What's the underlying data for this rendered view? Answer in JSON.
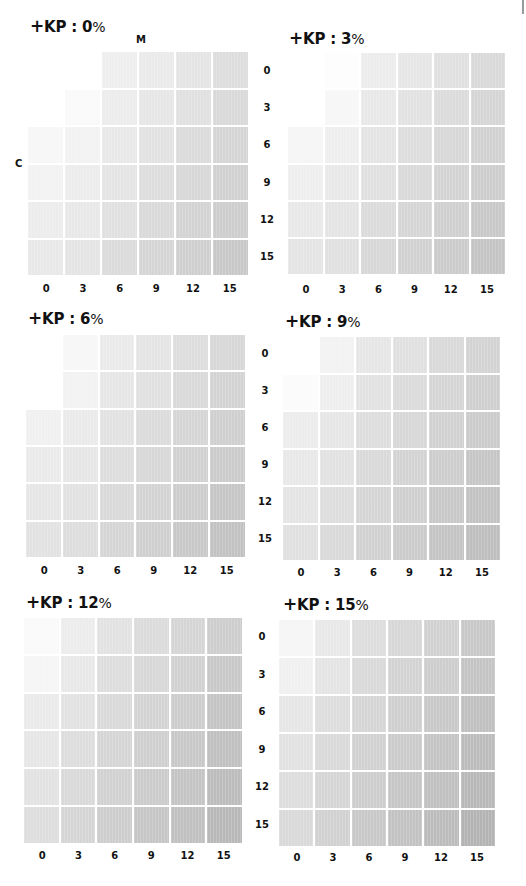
{
  "chart_data": [
    {
      "type": "heatmap",
      "title": "+KP : 0%",
      "xlabel": "M",
      "ylabel": "C",
      "x_ticks": [
        "0",
        "3",
        "6",
        "9",
        "12",
        "15"
      ],
      "y_ticks": [
        "0",
        "3",
        "6",
        "9",
        "12",
        "15"
      ],
      "grid": true,
      "values": [
        [
          0,
          0,
          8,
          10,
          13,
          16
        ],
        [
          0,
          3,
          9,
          12,
          15,
          18
        ],
        [
          4,
          6,
          11,
          14,
          17,
          20
        ],
        [
          6,
          9,
          13,
          16,
          19,
          22
        ],
        [
          9,
          11,
          15,
          18,
          21,
          24
        ],
        [
          11,
          13,
          17,
          20,
          23,
          26
        ]
      ]
    },
    {
      "type": "heatmap",
      "title": "+KP : 3%",
      "xlabel": "M",
      "ylabel": "C",
      "x_ticks": [
        "0",
        "3",
        "6",
        "9",
        "12",
        "15"
      ],
      "y_ticks": [
        "0",
        "3",
        "6",
        "9",
        "12",
        "15"
      ],
      "grid": true,
      "values": [
        [
          0,
          1,
          9,
          12,
          15,
          18
        ],
        [
          0,
          4,
          11,
          14,
          17,
          20
        ],
        [
          5,
          8,
          13,
          16,
          19,
          22
        ],
        [
          8,
          11,
          15,
          18,
          21,
          24
        ],
        [
          11,
          13,
          17,
          20,
          23,
          26
        ],
        [
          13,
          15,
          19,
          22,
          25,
          28
        ]
      ]
    },
    {
      "type": "heatmap",
      "title": "+KP : 6%",
      "xlabel": "M",
      "ylabel": "C",
      "x_ticks": [
        "0",
        "3",
        "6",
        "9",
        "12",
        "15"
      ],
      "y_ticks": [
        "0",
        "3",
        "6",
        "9",
        "12",
        "15"
      ],
      "grid": true,
      "values": [
        [
          0,
          4,
          10,
          13,
          16,
          19
        ],
        [
          0,
          6,
          12,
          15,
          18,
          21
        ],
        [
          7,
          10,
          14,
          17,
          20,
          23
        ],
        [
          10,
          12,
          16,
          19,
          22,
          25
        ],
        [
          12,
          14,
          18,
          21,
          24,
          27
        ],
        [
          14,
          16,
          20,
          23,
          26,
          29
        ]
      ]
    },
    {
      "type": "heatmap",
      "title": "+KP : 9%",
      "xlabel": "M",
      "ylabel": "C",
      "x_ticks": [
        "0",
        "3",
        "6",
        "9",
        "12",
        "15"
      ],
      "y_ticks": [
        "0",
        "3",
        "6",
        "9",
        "12",
        "15"
      ],
      "grid": true,
      "values": [
        [
          0,
          6,
          12,
          15,
          18,
          21
        ],
        [
          2,
          8,
          14,
          17,
          20,
          23
        ],
        [
          9,
          12,
          16,
          19,
          22,
          25
        ],
        [
          11,
          14,
          18,
          21,
          24,
          27
        ],
        [
          13,
          16,
          20,
          23,
          26,
          29
        ],
        [
          15,
          18,
          22,
          25,
          28,
          31
        ]
      ]
    },
    {
      "type": "heatmap",
      "title": "+KP : 12%",
      "xlabel": "M",
      "ylabel": "C",
      "x_ticks": [
        "0",
        "3",
        "6",
        "9",
        "12",
        "15"
      ],
      "y_ticks": [
        "0",
        "3",
        "6",
        "9",
        "12",
        "15"
      ],
      "grid": true,
      "values": [
        [
          3,
          9,
          14,
          17,
          20,
          24
        ],
        [
          5,
          11,
          16,
          19,
          22,
          26
        ],
        [
          10,
          14,
          18,
          21,
          24,
          28
        ],
        [
          12,
          16,
          20,
          23,
          26,
          30
        ],
        [
          14,
          18,
          22,
          25,
          28,
          32
        ],
        [
          16,
          20,
          24,
          27,
          30,
          34
        ]
      ]
    },
    {
      "type": "heatmap",
      "title": "+KP : 15%",
      "xlabel": "M",
      "ylabel": "C",
      "x_ticks": [
        "0",
        "3",
        "6",
        "9",
        "12",
        "15"
      ],
      "y_ticks": [
        "0",
        "3",
        "6",
        "9",
        "12",
        "15"
      ],
      "grid": true,
      "values": [
        [
          5,
          11,
          16,
          19,
          22,
          26
        ],
        [
          7,
          13,
          18,
          21,
          24,
          28
        ],
        [
          12,
          16,
          20,
          23,
          26,
          30
        ],
        [
          14,
          18,
          22,
          25,
          28,
          32
        ],
        [
          16,
          20,
          24,
          27,
          30,
          34
        ],
        [
          18,
          22,
          26,
          29,
          32,
          36
        ]
      ]
    }
  ],
  "panels": [
    {
      "plus": "+",
      "kp": "KP : 0",
      "pct": "%"
    },
    {
      "plus": "+",
      "kp": "KP : 3",
      "pct": "%"
    },
    {
      "plus": "+",
      "kp": "KP : 6",
      "pct": "%"
    },
    {
      "plus": "+",
      "kp": "KP : 9",
      "pct": "%"
    },
    {
      "plus": "+",
      "kp": "KP : 12",
      "pct": "%"
    },
    {
      "plus": "+",
      "kp": "KP : 15",
      "pct": "%"
    }
  ],
  "axis": {
    "m_label": "M",
    "c_label": "C"
  },
  "ticks": [
    "0",
    "3",
    "6",
    "9",
    "12",
    "15"
  ]
}
